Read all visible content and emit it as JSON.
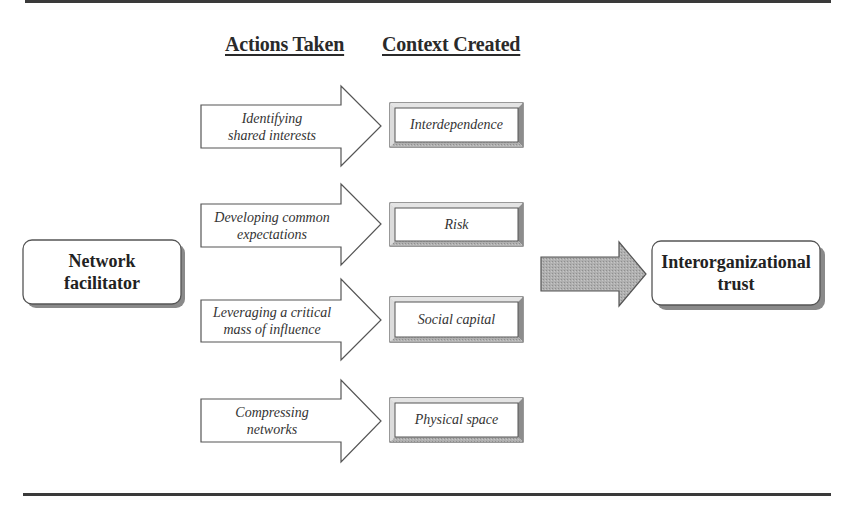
{
  "headings": {
    "actions": "Actions Taken",
    "context": "Context Created"
  },
  "source_node": {
    "line1": "Network",
    "line2": "facilitator"
  },
  "target_node": {
    "line1": "Interorganizational",
    "line2": "trust"
  },
  "rows": [
    {
      "action_line1": "Identifying",
      "action_line2": "shared interests",
      "context": "Interdependence"
    },
    {
      "action_line1": "Developing common",
      "action_line2": "expectations",
      "context": "Risk"
    },
    {
      "action_line1": "Leveraging a critical",
      "action_line2": "mass of influence",
      "context": "Social capital"
    },
    {
      "action_line1": "Compressing",
      "action_line2": "networks",
      "context": "Physical space"
    }
  ],
  "colors": {
    "rule": "#3a3a3a",
    "outline": "#555555",
    "big_arrow_fill": "#a9a9a9",
    "shadow": "#8a8a8a",
    "bevel_dark": "#8c8c8c",
    "bevel_light": "#d8d8d8"
  }
}
